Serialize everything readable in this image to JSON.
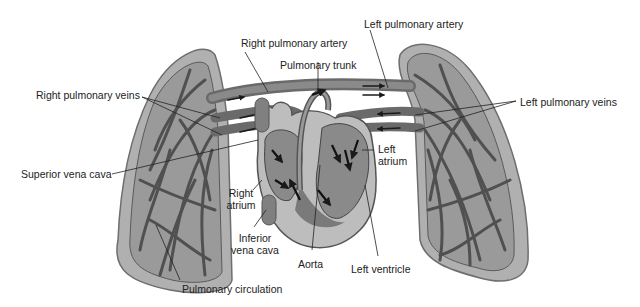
{
  "diagram": {
    "type": "anatomical illustration",
    "colors": {
      "lung_fill": "#a9a9a9",
      "lung_outline": "#707070",
      "vessel_dark": "#555555",
      "vessel_mid": "#7a7a7a",
      "heart_fill": "#8c8c8c",
      "heart_outer": "#b5b5b5",
      "arrow": "#1a1a1a",
      "label_text": "#222222",
      "background": "#ffffff"
    }
  },
  "labels": {
    "right_pulmonary_artery": "Right pulmonary artery",
    "left_pulmonary_artery": "Left pulmonary artery",
    "pulmonary_trunk": "Pulmonary trunk",
    "right_pulmonary_veins": "Right pulmonary veins",
    "left_pulmonary_veins": "Left pulmonary veins",
    "superior_vena_cava": "Superior vena cava",
    "left_atrium": "Left atrium",
    "right_atrium": "Right atrium",
    "inferior_vena_cava": "Inferior vena cava",
    "aorta": "Aorta",
    "left_ventricle": "Left ventricle",
    "pulmonary_circulation": "Pulmonary circulation"
  }
}
